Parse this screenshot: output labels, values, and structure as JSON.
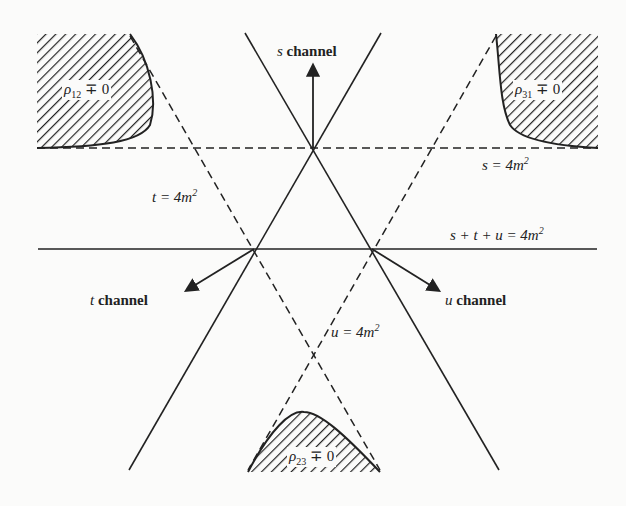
{
  "diagram": {
    "labels": {
      "s_channel": "channel",
      "s_var": "s",
      "t_channel": "channel",
      "t_var": "t",
      "u_channel": "channel",
      "u_var": "u",
      "s_eq": "s = 4m",
      "t_eq": "t = 4m",
      "u_eq": "u = 4m",
      "sum_eq": "s + t + u = 4m",
      "exp": "2",
      "rho12": "ρ",
      "rho12_sub": "12",
      "rho31": "ρ",
      "rho31_sub": "31",
      "rho23": "ρ",
      "rho23_sub": "23",
      "neq": " ∓ 0"
    },
    "colors": {
      "ink": "#222222",
      "background": "#fbfbfa"
    }
  }
}
